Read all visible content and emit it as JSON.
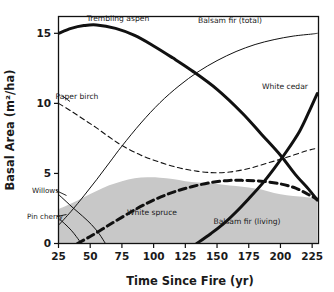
{
  "chart_data": {
    "type": "line",
    "title": "",
    "xlabel": "Time Since Fire (yr)",
    "ylabel": "Basal Area (m²/ha)",
    "xlim": [
      25,
      230
    ],
    "ylim": [
      0,
      16.2
    ],
    "xticks": [
      25,
      50,
      75,
      100,
      125,
      150,
      175,
      200,
      225
    ],
    "yticks": [
      0,
      5,
      10,
      15
    ],
    "grid": false,
    "legend": "inline-annotations",
    "colors": {
      "line": "#111111",
      "shaded_area": "#c8c8c8",
      "frame": "#111111",
      "background": "#ffffff"
    },
    "series": [
      {
        "name": "Trembling aspen",
        "style": "solid-thick",
        "label": "Trembling aspen",
        "label_x": 118,
        "label_y": 21,
        "points": [
          [
            25,
            15.0
          ],
          [
            35,
            15.35
          ],
          [
            45,
            15.55
          ],
          [
            55,
            15.6
          ],
          [
            70,
            15.35
          ],
          [
            85,
            14.85
          ],
          [
            100,
            14.1
          ],
          [
            115,
            13.25
          ],
          [
            130,
            12.35
          ],
          [
            150,
            11.0
          ],
          [
            170,
            9.3
          ],
          [
            185,
            7.8
          ],
          [
            200,
            6.3
          ],
          [
            212,
            4.9
          ],
          [
            222,
            3.9
          ],
          [
            229,
            3.1
          ]
        ]
      },
      {
        "name": "Balsam fir (total)",
        "style": "solid-thin",
        "label": "Balsam fir (total)",
        "label_x": 230,
        "label_y": 23,
        "points": [
          [
            25,
            1.3
          ],
          [
            35,
            2.3
          ],
          [
            45,
            3.4
          ],
          [
            55,
            4.55
          ],
          [
            65,
            5.75
          ],
          [
            75,
            6.95
          ],
          [
            90,
            8.6
          ],
          [
            105,
            10.05
          ],
          [
            120,
            11.25
          ],
          [
            135,
            12.25
          ],
          [
            150,
            13.05
          ],
          [
            165,
            13.7
          ],
          [
            180,
            14.2
          ],
          [
            195,
            14.55
          ],
          [
            210,
            14.8
          ],
          [
            225,
            14.95
          ],
          [
            229,
            15.0
          ]
        ]
      },
      {
        "name": "Paper birch",
        "style": "dashed-thin",
        "label": "Paper birch",
        "label_x": 77,
        "label_y": 99,
        "points": [
          [
            25,
            10.0
          ],
          [
            35,
            9.45
          ],
          [
            45,
            8.85
          ],
          [
            55,
            8.25
          ],
          [
            65,
            7.6
          ],
          [
            75,
            7.0
          ],
          [
            90,
            6.3
          ],
          [
            105,
            5.8
          ],
          [
            120,
            5.4
          ],
          [
            135,
            5.15
          ],
          [
            148,
            5.05
          ],
          [
            160,
            5.1
          ],
          [
            175,
            5.35
          ],
          [
            190,
            5.75
          ],
          [
            205,
            6.15
          ],
          [
            220,
            6.6
          ],
          [
            229,
            6.8
          ]
        ]
      },
      {
        "name": "White spruce",
        "style": "dashed-thick",
        "label": "White spruce",
        "label_x": 152,
        "label_y": 215,
        "points": [
          [
            40,
            0.0
          ],
          [
            50,
            0.5
          ],
          [
            60,
            1.05
          ],
          [
            70,
            1.6
          ],
          [
            85,
            2.4
          ],
          [
            100,
            3.1
          ],
          [
            115,
            3.65
          ],
          [
            130,
            4.05
          ],
          [
            145,
            4.35
          ],
          [
            160,
            4.5
          ],
          [
            172,
            4.5
          ],
          [
            185,
            4.45
          ],
          [
            200,
            4.25
          ],
          [
            212,
            3.95
          ],
          [
            222,
            3.5
          ],
          [
            229,
            3.15
          ]
        ]
      },
      {
        "name": "White cedar",
        "style": "solid-thick",
        "label": "White cedar",
        "label_x": 285,
        "label_y": 89,
        "points": [
          [
            134,
            0.0
          ],
          [
            145,
            0.7
          ],
          [
            155,
            1.4
          ],
          [
            165,
            2.25
          ],
          [
            175,
            3.2
          ],
          [
            185,
            4.2
          ],
          [
            195,
            5.35
          ],
          [
            205,
            6.6
          ],
          [
            215,
            8.0
          ],
          [
            222,
            9.3
          ],
          [
            229,
            10.7
          ]
        ]
      },
      {
        "name": "Balsam fir (living)",
        "style": "shaded-area",
        "label": "Balsam fir (living)",
        "label_x": 247,
        "label_y": 224,
        "points": [
          [
            25,
            2.45
          ],
          [
            35,
            2.85
          ],
          [
            45,
            3.3
          ],
          [
            55,
            3.75
          ],
          [
            65,
            4.15
          ],
          [
            75,
            4.45
          ],
          [
            85,
            4.65
          ],
          [
            95,
            4.72
          ],
          [
            105,
            4.7
          ],
          [
            115,
            4.6
          ],
          [
            125,
            4.45
          ],
          [
            135,
            4.35
          ],
          [
            145,
            4.3
          ],
          [
            155,
            4.2
          ],
          [
            165,
            4.1
          ],
          [
            175,
            4.0
          ],
          [
            185,
            3.85
          ],
          [
            195,
            3.6
          ],
          [
            205,
            3.45
          ],
          [
            215,
            3.35
          ],
          [
            225,
            3.25
          ],
          [
            229,
            3.2
          ]
        ]
      },
      {
        "name": "Willows",
        "style": "solid-thin",
        "label": "Willows",
        "label_x": 32,
        "label_y": 193,
        "points": [
          [
            25,
            3.5
          ],
          [
            31,
            3.0
          ],
          [
            37,
            2.5
          ],
          [
            44,
            1.95
          ],
          [
            51,
            1.35
          ],
          [
            57,
            0.7
          ],
          [
            62,
            0.0
          ]
        ]
      },
      {
        "name": "Pin cherry",
        "style": "solid-thin",
        "label": "Pin cherry",
        "label_x": 27,
        "label_y": 219,
        "points": [
          [
            25,
            1.8
          ],
          [
            30,
            1.4
          ],
          [
            35,
            0.95
          ],
          [
            39,
            0.5
          ],
          [
            43,
            0.0
          ]
        ]
      }
    ]
  },
  "axes": {
    "y_title": "Basal Area (m²/ha)",
    "x_title": "Time Since Fire (yr)",
    "y_tick_labels": [
      "15",
      "10",
      "5",
      "0"
    ],
    "x_tick_labels": [
      "25",
      "50",
      "75",
      "100",
      "125",
      "150",
      "175",
      "200",
      "225"
    ]
  },
  "annotations": {
    "trembling_aspen": "Trembling aspen",
    "balsam_fir_total": "Balsam fir (total)",
    "paper_birch": "Paper birch",
    "white_cedar": "White cedar",
    "white_spruce": "White spruce",
    "balsam_fir_living": "Balsam fir (living)",
    "willows": "Willows",
    "pin_cherry": "Pin cherry"
  }
}
